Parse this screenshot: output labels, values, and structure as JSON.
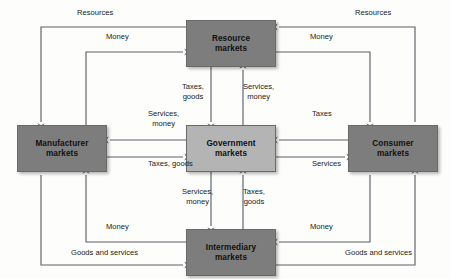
{
  "diagram": {
    "type": "flow-diagram",
    "canvas": {
      "width": 451,
      "height": 279
    },
    "colors": {
      "background": "#fdfdfc",
      "node_dark_fill": "#7d7d7d",
      "node_light_fill": "#b4b4b4",
      "node_border": "#6a6a6a",
      "line": "#5d6166",
      "label_text": "#1a1a1a",
      "node_text": "#101010"
    },
    "nodes": [
      {
        "id": "resource",
        "name": "resource-markets",
        "lines": [
          "Resource",
          "markets"
        ],
        "shade": "dark",
        "x": 186,
        "y": 20,
        "w": 90,
        "h": 47
      },
      {
        "id": "manufacturer",
        "name": "manufacturer-markets",
        "lines": [
          "Manufacturer",
          "markets"
        ],
        "shade": "dark",
        "x": 17,
        "y": 125,
        "w": 90,
        "h": 47
      },
      {
        "id": "government",
        "name": "government-markets",
        "lines": [
          "Government",
          "markets"
        ],
        "shade": "light",
        "x": 186,
        "y": 125,
        "w": 90,
        "h": 47
      },
      {
        "id": "consumer",
        "name": "consumer-markets",
        "lines": [
          "Consumer",
          "markets"
        ],
        "shade": "dark",
        "x": 348,
        "y": 125,
        "w": 90,
        "h": 47
      },
      {
        "id": "intermediary",
        "name": "intermediary-markets",
        "lines": [
          "Intermediary",
          "markets"
        ],
        "shade": "dark",
        "x": 186,
        "y": 229,
        "w": 90,
        "h": 47
      }
    ],
    "edges": [
      {
        "id": "resources-to-manufacturer",
        "from": "resource",
        "to": "manufacturer",
        "label": "Resources",
        "label_x": 77,
        "label_y": 8,
        "points": "186,27 41,27 41,122",
        "arrow": "down",
        "arrow_x": 41,
        "arrow_y": 124
      },
      {
        "id": "money-manufacturer-to-resource",
        "from": "manufacturer",
        "to": "resource",
        "label": "Money",
        "label_x": 106,
        "label_y": 32,
        "points": "86,125 86,52 183,52",
        "arrow": "right",
        "arrow_x": 185,
        "arrow_y": 52
      },
      {
        "id": "resources-consumer-to-resource",
        "from": "consumer",
        "to": "resource",
        "label": "Resources",
        "label_x": 355,
        "label_y": 8,
        "points": "415,122 415,27 279,27",
        "arrow": "left",
        "arrow_x": 277,
        "arrow_y": 27
      },
      {
        "id": "money-resource-to-consumer",
        "from": "resource",
        "to": "consumer",
        "label": "Money",
        "label_x": 310,
        "label_y": 32,
        "points": "276,52 370,52 370,122",
        "arrow": "down",
        "arrow_x": 370,
        "arrow_y": 124
      },
      {
        "id": "taxes-goods-resource-to-government",
        "from": "resource",
        "to": "government",
        "label": "Taxes,\ngoods",
        "label_x": 182,
        "label_y": 82,
        "points": "211,67 211,122",
        "arrow": "down",
        "arrow_x": 211,
        "arrow_y": 124
      },
      {
        "id": "services-money-government-to-resource",
        "from": "government",
        "to": "resource",
        "label": "Services,\nmoney",
        "label_x": 243,
        "label_y": 82,
        "points": "243,125 243,70",
        "arrow": "up",
        "arrow_x": 243,
        "arrow_y": 68
      },
      {
        "id": "services-money-government-to-manufacturer",
        "from": "government",
        "to": "manufacturer",
        "label": "Services,\nmoney",
        "label_x": 148,
        "label_y": 109,
        "points": "186,140 110,140",
        "arrow": "left",
        "arrow_x": 108,
        "arrow_y": 140
      },
      {
        "id": "taxes-goods-manufacturer-to-government",
        "from": "manufacturer",
        "to": "government",
        "label": "Taxes, goods",
        "label_x": 148,
        "label_y": 159,
        "points": "107,157 183,157",
        "arrow": "right",
        "arrow_x": 185,
        "arrow_y": 157
      },
      {
        "id": "taxes-consumer-to-government",
        "from": "consumer",
        "to": "government",
        "label": "Taxes",
        "label_x": 312,
        "label_y": 109,
        "points": "348,140 279,140",
        "arrow": "left",
        "arrow_x": 277,
        "arrow_y": 140
      },
      {
        "id": "services-government-to-consumer",
        "from": "government",
        "to": "consumer",
        "label": "Services",
        "label_x": 312,
        "label_y": 159,
        "points": "276,157 345,157",
        "arrow": "right",
        "arrow_x": 347,
        "arrow_y": 157
      },
      {
        "id": "services-money-government-to-intermediary",
        "from": "government",
        "to": "intermediary",
        "label": "Services,\nmoney",
        "label_x": 182,
        "label_y": 187,
        "points": "211,172 211,226",
        "arrow": "down",
        "arrow_x": 211,
        "arrow_y": 228
      },
      {
        "id": "taxes-goods-intermediary-to-government",
        "from": "intermediary",
        "to": "government",
        "label": "Taxes,\ngoods",
        "label_x": 243,
        "label_y": 187,
        "points": "243,229 243,175",
        "arrow": "up",
        "arrow_x": 243,
        "arrow_y": 173
      },
      {
        "id": "money-intermediary-to-manufacturer",
        "from": "intermediary",
        "to": "manufacturer",
        "label": "Money",
        "label_x": 106,
        "label_y": 222,
        "points": "186,242 86,242 86,175",
        "arrow": "up",
        "arrow_x": 86,
        "arrow_y": 173
      },
      {
        "id": "goods-services-manufacturer-to-intermediary",
        "from": "manufacturer",
        "to": "intermediary",
        "label": "Goods and services",
        "label_x": 71,
        "label_y": 248,
        "points": "41,175 41,265 183,265",
        "arrow": "right",
        "arrow_x": 185,
        "arrow_y": 265
      },
      {
        "id": "money-consumer-to-intermediary",
        "from": "consumer",
        "to": "intermediary",
        "label": "Money",
        "label_x": 310,
        "label_y": 222,
        "points": "370,175 370,242 279,242",
        "arrow": "left",
        "arrow_x": 277,
        "arrow_y": 242
      },
      {
        "id": "goods-services-intermediary-to-consumer",
        "from": "intermediary",
        "to": "consumer",
        "label": "Goods and services",
        "label_x": 345,
        "label_y": 248,
        "points": "276,265 415,265 415,175",
        "arrow": "up",
        "arrow_x": 415,
        "arrow_y": 173
      }
    ]
  }
}
